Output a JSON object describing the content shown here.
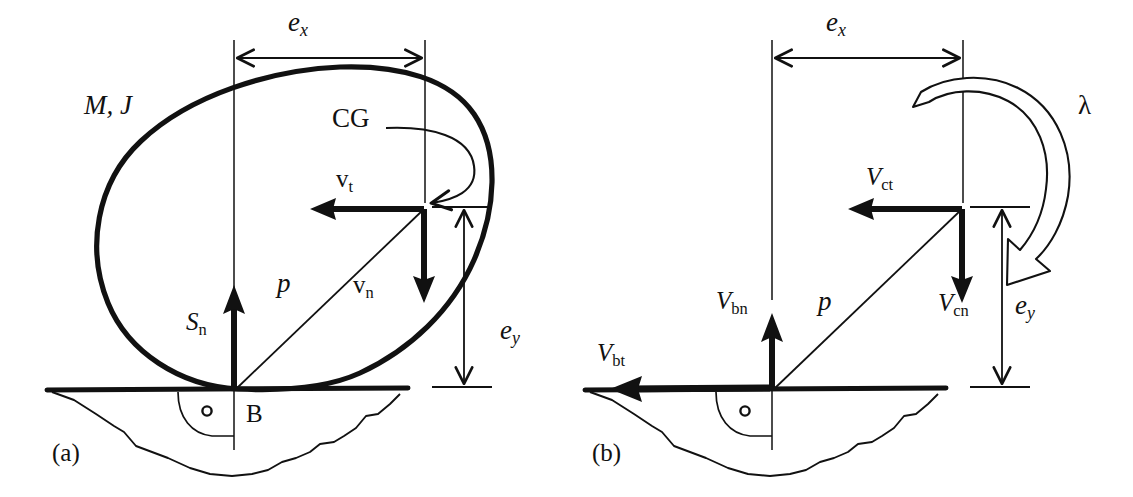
{
  "figure": {
    "background_color": "#ffffff",
    "ink_color": "#111111",
    "panels": [
      {
        "id": "a",
        "caption": "(a)",
        "body_label": "M, J",
        "cg_label": "CG",
        "point_label": "B",
        "angle_marker": "o",
        "dim_x_label": "e",
        "dim_x_sub": "x",
        "dim_y_label": "e",
        "dim_y_sub": "y",
        "vectors": [
          {
            "name": "tangential-velocity",
            "label": "v",
            "sub": "t",
            "direction": "left"
          },
          {
            "name": "normal-velocity",
            "label": "v",
            "sub": "n",
            "direction": "down"
          },
          {
            "name": "normal-impulse",
            "label": "S",
            "sub": "n",
            "direction": "up"
          }
        ],
        "radius_label": "p"
      },
      {
        "id": "b",
        "caption": "(b)",
        "dim_x_label": "e",
        "dim_x_sub": "x",
        "dim_y_label": "e",
        "dim_y_sub": "y",
        "rotation_label": "λ",
        "angle_marker": "o",
        "vectors": [
          {
            "name": "contact-tangential-velocity",
            "label": "V",
            "sub": "ct",
            "direction": "left"
          },
          {
            "name": "contact-normal-velocity",
            "label": "V",
            "sub": "cn",
            "direction": "down"
          },
          {
            "name": "body-normal-velocity",
            "label": "V",
            "sub": "bn",
            "direction": "up"
          },
          {
            "name": "body-tangential-velocity",
            "label": "V",
            "sub": "bt",
            "direction": "left"
          }
        ],
        "radius_label": "p"
      }
    ]
  }
}
